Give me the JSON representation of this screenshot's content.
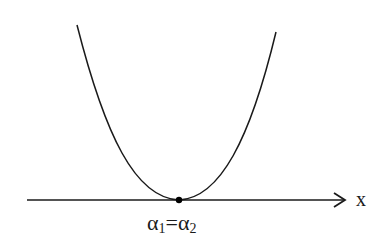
{
  "diagram": {
    "type": "parabola-tangent-to-axis",
    "axis": {
      "label": "x",
      "from": [
        27,
        200
      ],
      "to": [
        346,
        200
      ]
    },
    "curve": {
      "left_top": [
        77,
        25
      ],
      "vertex": [
        179,
        200
      ],
      "right_top": [
        276,
        32
      ]
    },
    "point": {
      "x": 179,
      "y": 200,
      "r": 3.2
    },
    "root_label": {
      "alpha1": "α",
      "sub1": "1",
      "eq": "=",
      "alpha2": "α",
      "sub2": "2"
    },
    "colors": {
      "stroke": "#1a1a1a",
      "background": "#ffffff"
    }
  }
}
